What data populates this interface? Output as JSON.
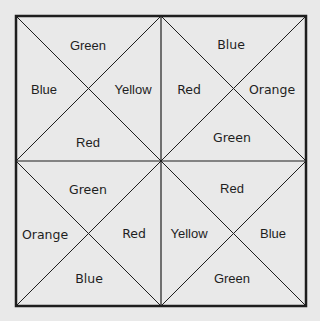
{
  "colors": {
    "background": "#e9e9e9",
    "line": "#1e1e1e",
    "text": "#1e1e1e"
  },
  "grid": {
    "outer": {
      "left": 16,
      "top": 16,
      "right": 306,
      "bottom": 306
    },
    "center": {
      "x": 161,
      "y": 161
    }
  },
  "quadrants": {
    "top_left": {
      "top": "Green",
      "left": "Blue",
      "right": "Yellow",
      "bottom": "Red"
    },
    "top_right": {
      "top": "Blue",
      "left": "Red",
      "right": "Orange",
      "bottom": "Green"
    },
    "bottom_left": {
      "top": "Green",
      "left": "Orange",
      "right": "Red",
      "bottom": "Blue"
    },
    "bottom_right": {
      "top": "Red",
      "left": "Yellow",
      "right": "Blue",
      "bottom": "Green"
    }
  }
}
